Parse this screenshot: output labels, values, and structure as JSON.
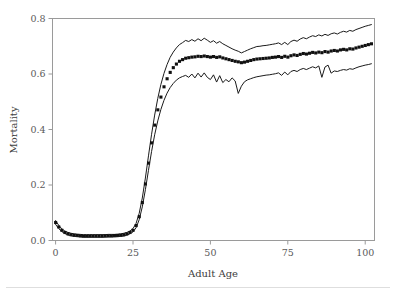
{
  "chart_data": {
    "type": "line",
    "title": "",
    "subtitle": "",
    "xlabel": "Adult Age",
    "ylabel": "Mortality",
    "xlim": [
      -1,
      103
    ],
    "ylim": [
      0.0,
      0.8
    ],
    "xticks": [
      0,
      25,
      50,
      75,
      100
    ],
    "xtick_labels": [
      "0",
      "25",
      "50",
      "75",
      "100"
    ],
    "yticks": [
      0.0,
      0.2,
      0.4,
      0.6,
      0.8
    ],
    "ytick_labels": [
      "0.0",
      "0.2",
      "0.4",
      "0.6",
      "0.8"
    ],
    "grid": false,
    "legend": null,
    "legend_position": "none",
    "annotations": [],
    "x": [
      0,
      1,
      2,
      3,
      4,
      5,
      6,
      7,
      8,
      9,
      10,
      11,
      12,
      13,
      14,
      15,
      16,
      17,
      18,
      19,
      20,
      21,
      22,
      23,
      24,
      25,
      26,
      27,
      28,
      29,
      30,
      31,
      32,
      33,
      34,
      35,
      36,
      37,
      38,
      39,
      40,
      41,
      42,
      43,
      44,
      45,
      46,
      47,
      48,
      49,
      50,
      51,
      52,
      53,
      54,
      55,
      56,
      57,
      58,
      59,
      60,
      61,
      62,
      63,
      64,
      65,
      66,
      67,
      68,
      69,
      70,
      71,
      72,
      73,
      74,
      75,
      76,
      77,
      78,
      79,
      80,
      81,
      82,
      83,
      84,
      85,
      86,
      87,
      88,
      89,
      90,
      91,
      92,
      93,
      94,
      95,
      96,
      97,
      98,
      99,
      100,
      101,
      102
    ],
    "series": [
      {
        "name": "upper-confidence-band",
        "style": "line",
        "color": "#1a1a1a",
        "values": [
          0.072,
          0.055,
          0.042,
          0.034,
          0.029,
          0.026,
          0.024,
          0.023,
          0.022,
          0.021,
          0.021,
          0.021,
          0.021,
          0.021,
          0.021,
          0.021,
          0.021,
          0.022,
          0.022,
          0.022,
          0.023,
          0.024,
          0.026,
          0.029,
          0.034,
          0.043,
          0.062,
          0.098,
          0.153,
          0.225,
          0.305,
          0.383,
          0.452,
          0.512,
          0.562,
          0.602,
          0.634,
          0.66,
          0.679,
          0.694,
          0.706,
          0.713,
          0.721,
          0.717,
          0.724,
          0.718,
          0.727,
          0.72,
          0.729,
          0.722,
          0.714,
          0.72,
          0.711,
          0.717,
          0.709,
          0.703,
          0.697,
          0.691,
          0.686,
          0.682,
          0.676,
          0.681,
          0.686,
          0.691,
          0.695,
          0.699,
          0.7,
          0.702,
          0.703,
          0.705,
          0.707,
          0.709,
          0.712,
          0.706,
          0.714,
          0.706,
          0.717,
          0.722,
          0.718,
          0.726,
          0.731,
          0.727,
          0.733,
          0.738,
          0.735,
          0.741,
          0.737,
          0.743,
          0.739,
          0.745,
          0.748,
          0.744,
          0.75,
          0.754,
          0.751,
          0.757,
          0.754,
          0.76,
          0.764,
          0.768,
          0.772,
          0.775,
          0.778
        ]
      },
      {
        "name": "mortality-estimate",
        "style": "markers",
        "color": "#101010",
        "values": [
          0.065,
          0.049,
          0.037,
          0.029,
          0.024,
          0.021,
          0.019,
          0.018,
          0.017,
          0.016,
          0.016,
          0.016,
          0.016,
          0.016,
          0.016,
          0.016,
          0.017,
          0.017,
          0.017,
          0.018,
          0.018,
          0.019,
          0.021,
          0.024,
          0.029,
          0.037,
          0.054,
          0.086,
          0.137,
          0.204,
          0.279,
          0.352,
          0.416,
          0.471,
          0.517,
          0.554,
          0.583,
          0.606,
          0.623,
          0.636,
          0.646,
          0.652,
          0.657,
          0.659,
          0.661,
          0.662,
          0.664,
          0.663,
          0.665,
          0.663,
          0.661,
          0.663,
          0.66,
          0.662,
          0.658,
          0.655,
          0.652,
          0.649,
          0.646,
          0.644,
          0.641,
          0.643,
          0.646,
          0.649,
          0.652,
          0.654,
          0.655,
          0.656,
          0.657,
          0.658,
          0.66,
          0.661,
          0.663,
          0.66,
          0.664,
          0.661,
          0.666,
          0.669,
          0.667,
          0.671,
          0.674,
          0.672,
          0.675,
          0.678,
          0.676,
          0.679,
          0.677,
          0.681,
          0.679,
          0.683,
          0.685,
          0.683,
          0.687,
          0.689,
          0.687,
          0.691,
          0.69,
          0.694,
          0.697,
          0.7,
          0.703,
          0.706,
          0.709
        ]
      },
      {
        "name": "lower-confidence-band",
        "style": "line",
        "color": "#1a1a1a",
        "values": [
          0.058,
          0.043,
          0.032,
          0.025,
          0.02,
          0.017,
          0.015,
          0.014,
          0.013,
          0.012,
          0.012,
          0.012,
          0.012,
          0.012,
          0.012,
          0.012,
          0.012,
          0.013,
          0.013,
          0.013,
          0.014,
          0.015,
          0.016,
          0.019,
          0.024,
          0.031,
          0.046,
          0.075,
          0.121,
          0.183,
          0.253,
          0.321,
          0.381,
          0.431,
          0.472,
          0.505,
          0.531,
          0.551,
          0.566,
          0.578,
          0.586,
          0.591,
          0.595,
          0.588,
          0.6,
          0.586,
          0.603,
          0.589,
          0.604,
          0.588,
          0.58,
          0.597,
          0.571,
          0.594,
          0.569,
          0.58,
          0.572,
          0.586,
          0.575,
          0.53,
          0.556,
          0.572,
          0.579,
          0.583,
          0.587,
          0.59,
          0.592,
          0.594,
          0.596,
          0.597,
          0.599,
          0.601,
          0.604,
          0.595,
          0.607,
          0.597,
          0.609,
          0.613,
          0.609,
          0.616,
          0.62,
          0.616,
          0.621,
          0.626,
          0.622,
          0.629,
          0.588,
          0.625,
          0.632,
          0.603,
          0.611,
          0.609,
          0.613,
          0.616,
          0.614,
          0.619,
          0.617,
          0.622,
          0.626,
          0.629,
          0.632,
          0.634,
          0.637
        ]
      }
    ]
  },
  "axis": {
    "y_label": "Mortality",
    "x_label": "Adult Age"
  }
}
